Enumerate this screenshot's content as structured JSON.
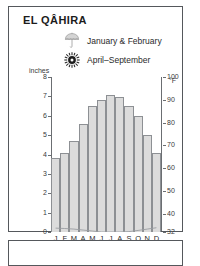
{
  "panel": {
    "title": "EL QÂHIRA"
  },
  "legend": {
    "items": [
      {
        "icon": "umbrella-icon",
        "label": "January & February"
      },
      {
        "icon": "sun-icon",
        "label": "April–September"
      }
    ]
  },
  "chart_data": {
    "type": "bar",
    "title": "EL QÂHIRA",
    "categories": [
      "J",
      "F",
      "M",
      "A",
      "M",
      "J",
      "J",
      "A",
      "S",
      "O",
      "N",
      "D"
    ],
    "series": [
      {
        "name": "Temperature",
        "unit": "°F",
        "values": [
          3.8,
          4.1,
          4.7,
          5.6,
          6.5,
          6.8,
          7.05,
          6.95,
          6.5,
          6.0,
          5.0,
          4.1
        ]
      },
      {
        "name": "Precipitation",
        "unit": "inches",
        "values": [
          0.2,
          0.18,
          0.15,
          0.1,
          0.05,
          0.0,
          0.0,
          0.0,
          0.02,
          0.08,
          0.15,
          0.22
        ]
      }
    ],
    "xlabel": "",
    "ylabel": "inches",
    "ylabel_right": "°F",
    "ylim": [
      0,
      8
    ],
    "ylim_right": [
      32,
      100
    ],
    "grid": false,
    "legend_position": "top"
  },
  "axes": {
    "left": {
      "unit": "inches",
      "ticks": [
        "8",
        "7",
        "6",
        "5",
        "4",
        "3",
        "2",
        "1",
        "0"
      ]
    },
    "right": {
      "unit": "°F",
      "ticks": [
        "100",
        "90",
        "80",
        "70",
        "60",
        "50",
        "40",
        "32"
      ]
    },
    "months": [
      "J",
      "F",
      "M",
      "A",
      "M",
      "J",
      "J",
      "A",
      "S",
      "O",
      "N",
      "D"
    ]
  },
  "colors": {
    "bar_fill": "#dcdcdc",
    "bar_stroke": "#8d9094",
    "axis": "#6b6e72",
    "border": "#55585c",
    "text": "#2a2a2a"
  }
}
